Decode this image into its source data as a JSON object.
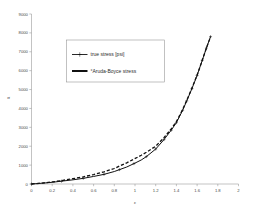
{
  "chart_data": {
    "type": "line",
    "title": "",
    "xlabel": "ε",
    "ylabel": "σ",
    "xlim": [
      0,
      2
    ],
    "ylim": [
      0,
      9000
    ],
    "xticks": [
      "0",
      "0.2",
      "0.4",
      "0.6",
      "0.8",
      "1",
      "1.2",
      "1.4",
      "1.6",
      "1.8",
      "2"
    ],
    "xtick_values": [
      0,
      0.2,
      0.4,
      0.6,
      0.8,
      1.0,
      1.2,
      1.4,
      1.6,
      1.8,
      2.0
    ],
    "yticks": [
      "0",
      "1000",
      "2000",
      "3000",
      "4000",
      "5000",
      "6000",
      "7000",
      "8000",
      "9000"
    ],
    "ytick_values": [
      0,
      1000,
      2000,
      3000,
      4000,
      5000,
      6000,
      7000,
      8000,
      9000
    ],
    "grid": false,
    "legend_position": "upper-left-center",
    "series": [
      {
        "name": "true stress [psi]",
        "style": "solid-with-markers",
        "color": "#111111",
        "x": [
          0.0,
          0.1,
          0.2,
          0.29,
          0.4,
          0.5,
          0.6,
          0.7,
          0.8,
          0.85,
          0.92,
          0.99,
          1.06,
          1.11,
          1.2,
          1.28,
          1.35,
          1.4,
          1.46,
          1.5,
          1.55,
          1.6,
          1.65,
          1.69,
          1.73
        ],
        "y": [
          0,
          40,
          90,
          150,
          220,
          300,
          400,
          510,
          660,
          760,
          900,
          1080,
          1270,
          1450,
          1850,
          2350,
          2850,
          3250,
          3900,
          4400,
          5050,
          5750,
          6550,
          7200,
          7800
        ],
        "marker_x": [
          0.0,
          0.29,
          0.5,
          0.7,
          0.85,
          0.99,
          1.11,
          1.2,
          1.28,
          1.35,
          1.4,
          1.46,
          1.5,
          1.55,
          1.6,
          1.65,
          1.69,
          1.73
        ],
        "marker_y": [
          0,
          150,
          300,
          510,
          760,
          1080,
          1450,
          1850,
          2350,
          2850,
          3250,
          3900,
          4400,
          5050,
          5750,
          6550,
          7200,
          7800
        ]
      },
      {
        "name": "°Aruda-Boyce stress",
        "style": "dashed",
        "color": "#111111",
        "x": [
          0.0,
          0.1,
          0.2,
          0.29,
          0.4,
          0.5,
          0.6,
          0.7,
          0.8,
          0.85,
          0.92,
          0.99,
          1.06,
          1.11,
          1.2,
          1.28,
          1.35,
          1.4,
          1.46,
          1.5,
          1.55,
          1.6,
          1.65,
          1.69,
          1.73
        ],
        "y": [
          0,
          50,
          110,
          180,
          280,
          380,
          500,
          640,
          820,
          950,
          1120,
          1320,
          1520,
          1680,
          2000,
          2450,
          2920,
          3300,
          3940,
          4430,
          5070,
          5760,
          6550,
          7200,
          7800
        ]
      }
    ],
    "legend": [
      {
        "label": "true stress [psi]",
        "style": "solid-with-markers"
      },
      {
        "label": "°Aruda-Boyce stress",
        "style": "dashed-thick"
      }
    ]
  }
}
